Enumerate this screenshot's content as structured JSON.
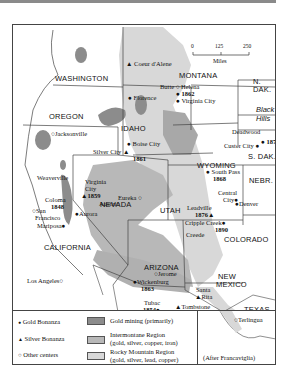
{
  "map": {
    "title": "Western US Mining Regions",
    "colors": {
      "gold_mining": "#8c8c8c",
      "intermontane": "#b8b8b8",
      "rocky_mountain": "#d8d8d8",
      "border": "#444444"
    },
    "scale": {
      "ticks": [
        "0",
        "125",
        "250"
      ],
      "unit": "Miles"
    },
    "states": {
      "washington": "WASHINGTON",
      "oregon": "OREGON",
      "idaho": "IDAHO",
      "montana": "MONTANA",
      "n_dak": "N.\nDAK.",
      "s_dak": "S. DAK.",
      "wyoming": "WYOMING",
      "nebr": "NEBR.",
      "nevada": "NEVADA",
      "utah": "UTAH",
      "colorado": "COLORADO",
      "california": "CALIFORNIA",
      "arizona": "ARIZONA",
      "new_mexico_1": "NEW",
      "new_mexico_2": "MEXICO",
      "texas": "TEXAS"
    },
    "regions": {
      "black_hills_1": "Black",
      "black_hills_2": "Hills"
    },
    "places": {
      "coeur_dalene": "Coeur d'Alene",
      "helena": "Helena",
      "butte": "Butte",
      "florence": "Florence",
      "virginia_city_mt": "Virginia City",
      "virginia_city_mt_year": "1862",
      "jacksonville": "Jacksonville",
      "boise_city": "Boise City",
      "silver_city": "Silver City",
      "silver_city_year": "1861",
      "deadwood": "Deadwood",
      "deadwood_year": "1874",
      "custer_city": "Custer City",
      "south_pass": "South Pass",
      "south_pass_year": "1868",
      "weaverville": "Weaverville",
      "virginia_city_nv_1": "Virginia",
      "virginia_city_nv_2": "City",
      "virginia_city_nv_year": "1859",
      "eureka": "Eureka",
      "austin": "Austin",
      "coloma": "Coloma",
      "coloma_year": "1848",
      "san_francisco_1": "San",
      "san_francisco_2": "Francisco",
      "aurora": "Aurora",
      "mariposa": "Mariposa",
      "central_city_1": "Central",
      "central_city_2": "City",
      "denver": "Denver",
      "leadville": "Leadville",
      "leadville_year": "1876",
      "cripple_creek": "Cripple Creek",
      "cripple_creek_year": "1890",
      "creede": "Creede",
      "los_angeles": "Los Angeles",
      "jerome": "Jerome",
      "wickenburg": "Wickenburg",
      "wickenburg_year": "1863",
      "santa_rita_1": "Santa",
      "santa_rita_2": "Rita",
      "tubac": "Tubac",
      "tubac_year": "1854",
      "tombstone": "Tombstone",
      "tombstone_year": "1878",
      "terlingua": "Terlingua"
    }
  },
  "legend": {
    "symbols": [
      {
        "glyph": "●",
        "label": "Gold Bonanza"
      },
      {
        "glyph": "▲",
        "label": "Silver Bonanza"
      },
      {
        "glyph": "○",
        "label": "Other centers"
      }
    ],
    "areas": [
      {
        "line1": "Gold mining (primarily)",
        "line2": ""
      },
      {
        "line1": "Intermontane Region",
        "line2": "(gold, silver, copper, iron)"
      },
      {
        "line1": "Rocky Mountain Region",
        "line2": "(gold, silver, lead, copper)"
      }
    ]
  },
  "source": "(After Francaviglia)"
}
